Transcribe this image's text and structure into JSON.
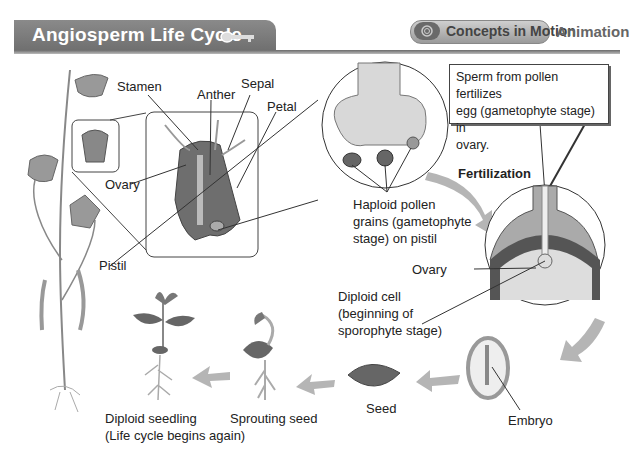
{
  "header": {
    "title": "Angiosperm Life Cycle",
    "key_icon": "key-icon",
    "concepts_button": {
      "icon": "concepts-in-motion-icon",
      "label": "Concepts in Motion"
    },
    "animation_label": "Animation"
  },
  "labels": {
    "stamen": "Stamen",
    "anther": "Anther",
    "sepal": "Sepal",
    "petal": "Petal",
    "ovary_flower": "Ovary",
    "pistil": "Pistil",
    "haploid": [
      "Haploid pollen",
      "grains (gametophyte",
      "stage) on pistil"
    ],
    "callout": [
      "Sperm from pollen fertilizes",
      "egg (gametophyte stage) in",
      "ovary."
    ],
    "fertilization": "Fertilization",
    "ovary_fert": "Ovary",
    "diploid_cell": [
      "Diploid cell",
      "(beginning of",
      "sporophyte stage)"
    ],
    "embryo": "Embryo",
    "seed": "Seed",
    "sprouting_seed": "Sprouting seed",
    "diploid_seedling": [
      "Diploid seedling",
      "(Life cycle begins again)"
    ]
  },
  "colors": {
    "header_bg": "#7a7a7a",
    "arrow": "#b5b5b5",
    "line": "#333333"
  }
}
